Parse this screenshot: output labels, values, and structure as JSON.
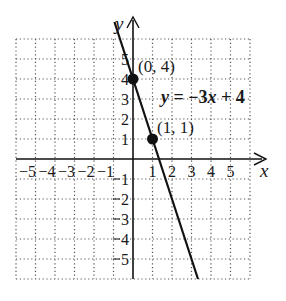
{
  "chart_data": {
    "type": "line",
    "title": "",
    "xlabel": "x",
    "ylabel": "y",
    "xlim": [
      -6,
      6
    ],
    "ylim": [
      -6,
      6
    ],
    "grid": true,
    "grid_style": "dotted",
    "x_ticks": [
      -5,
      -4,
      -3,
      -2,
      -1,
      1,
      2,
      3,
      4,
      5
    ],
    "y_ticks": [
      -5,
      -4,
      -3,
      -2,
      -1,
      1,
      2,
      3,
      4,
      5
    ],
    "x_tick_labels": [
      "−5",
      "−4",
      "−3",
      "−2",
      "−1",
      "1",
      "2",
      "3",
      "4",
      "5"
    ],
    "y_tick_labels": [
      "5",
      "4",
      "3",
      "2",
      "1",
      "1",
      "2",
      "3",
      "4",
      "5"
    ],
    "series": [
      {
        "name": "y = −3x + 4",
        "equation": {
          "slope": -3,
          "intercept": 4
        },
        "x": [
          -0.95,
          3.333
        ],
        "y": [
          6.85,
          -6
        ],
        "color": "#111111"
      }
    ],
    "points": [
      {
        "x": 0,
        "y": 4,
        "label": "(0, 4)"
      },
      {
        "x": 1,
        "y": 1,
        "label": "(1, 1)"
      }
    ],
    "annotations": [
      {
        "text": "y = −3x + 4",
        "x": 1.45,
        "y": 2.75
      }
    ]
  },
  "labels": {
    "x_axis": "x",
    "y_axis": "y",
    "equation_parts": {
      "y": "y",
      "eq": " = −3",
      "x": "x",
      "rest": " + 4"
    },
    "point_a": "(0, 4)",
    "point_b": "(1, 1)"
  },
  "colors": {
    "background": "#ffffff",
    "ink": "#111111",
    "grid": "#555555"
  }
}
